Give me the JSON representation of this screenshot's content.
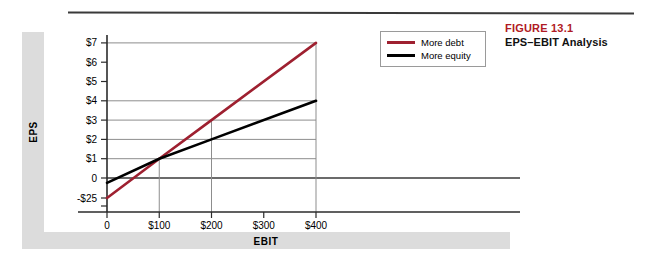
{
  "caption": {
    "figure_number": "FIGURE 13.1",
    "title": "EPS–EBIT Analysis"
  },
  "legend": {
    "items": [
      {
        "label": "More debt",
        "color": "#9e2030"
      },
      {
        "label": "More equity",
        "color": "#000000"
      }
    ]
  },
  "axis_bands": {
    "y_label": "EPS",
    "x_label": "EBIT"
  },
  "chart_data": {
    "type": "line",
    "title": "EPS–EBIT Analysis",
    "xlabel": "EBIT",
    "ylabel": "EPS",
    "xlim": [
      0,
      440
    ],
    "ylim": [
      -25,
      7
    ],
    "grid": true,
    "legend_position": "top-right",
    "x_ticks": [
      0,
      100,
      200,
      300,
      400
    ],
    "x_tick_labels": [
      "0",
      "$100",
      "$200",
      "$300",
      "$400"
    ],
    "y_ticks": [
      7,
      6,
      5,
      4,
      3,
      2,
      1,
      0,
      -25
    ],
    "y_tick_labels": [
      "$7",
      "$6",
      "$5",
      "$4",
      "$3",
      "$2",
      "$1",
      "0",
      "-$25"
    ],
    "gridline_y_values": [
      7,
      4,
      3,
      2,
      1,
      0
    ],
    "gridline_x_values": [
      100,
      200,
      400
    ],
    "series": [
      {
        "name": "More debt",
        "color": "#9e2030",
        "x": [
          0,
          100,
          200,
          400
        ],
        "y": [
          -25,
          1,
          3,
          7
        ]
      },
      {
        "name": "More equity",
        "color": "#000000",
        "x": [
          0,
          100,
          200,
          400
        ],
        "y": [
          -0.25,
          1,
          2,
          4
        ]
      }
    ],
    "crossover_point": {
      "x": 100,
      "y": 1
    }
  }
}
